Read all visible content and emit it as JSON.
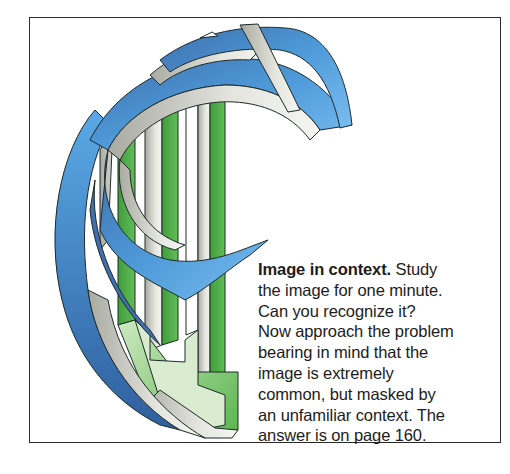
{
  "figure": {
    "illustration": {
      "description": "impossible-figure ribbon illustration of a stylized letter/shape with interwoven blue, gray and green bands",
      "colors": {
        "blue_dark": "#3f6fae",
        "blue_light": "#5aa9e6",
        "gray": "#b9bbb2",
        "gray_light": "#eef0ea",
        "green": "#52b04a",
        "green_light": "#b9dfa9",
        "outline": "#1e2a2a"
      }
    },
    "caption": {
      "title": "Image in context.",
      "lines": [
        "Study",
        "the image for one minute.",
        "Can you recognize it?",
        "Now approach the problem",
        "bearing in mind that the",
        "image is extremely",
        "common, but masked by",
        "an unfamiliar context. The",
        "answer is on page 160."
      ]
    }
  }
}
